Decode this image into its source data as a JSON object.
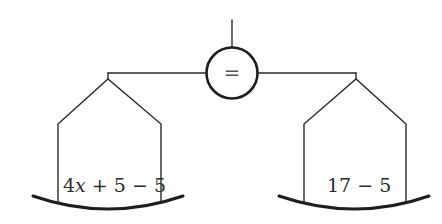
{
  "diagram": {
    "type": "balance-scale",
    "center_symbol": "=",
    "left_pan": {
      "expression_parts": [
        "4",
        "x",
        " + 5 − 5"
      ],
      "expression": "4x + 5 − 5"
    },
    "right_pan": {
      "expression": "17 − 5"
    }
  },
  "colors": {
    "stroke": "#2b2b2b",
    "background": "#ffffff"
  }
}
